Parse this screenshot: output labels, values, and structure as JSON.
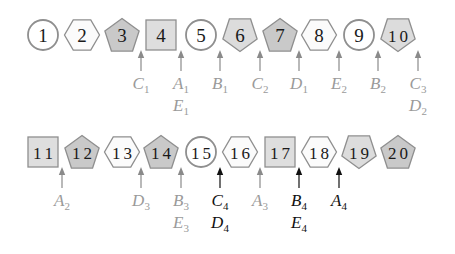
{
  "diagram": {
    "colors": {
      "circle_fill": "#ffffff",
      "hexagon_fill": "#fbfbfb",
      "pentagon_up_fill": "#c9c9c9",
      "square_fill": "#dedede",
      "pentagon_down_fill": "#dcdcdc",
      "outline": "#8f8f8f",
      "arrow_gray": "#8a8a8a",
      "arrow_black": "#111111",
      "number_text": "#1a1a1a"
    },
    "rows": [
      {
        "y": 35,
        "nodes": [
          {
            "n": "1",
            "shape": "circle",
            "x": 43
          },
          {
            "n": "2",
            "shape": "hexagon",
            "x": 82
          },
          {
            "n": "3",
            "shape": "pentagon-up",
            "x": 122
          },
          {
            "n": "4",
            "shape": "square",
            "x": 161
          },
          {
            "n": "5",
            "shape": "circle",
            "x": 201
          },
          {
            "n": "6",
            "shape": "pentagon-down",
            "x": 240
          },
          {
            "n": "7",
            "shape": "pentagon-up",
            "x": 280
          },
          {
            "n": "8",
            "shape": "hexagon",
            "x": 319
          },
          {
            "n": "9",
            "shape": "circle",
            "x": 359
          },
          {
            "n": "10",
            "shape": "pentagon-down",
            "x": 398
          }
        ],
        "pointers": [
          {
            "x": 141,
            "color": "gray",
            "labels": [
              [
                "C",
                "1"
              ]
            ]
          },
          {
            "x": 181,
            "color": "gray",
            "labels": [
              [
                "A",
                "1"
              ],
              [
                "E",
                "1"
              ]
            ]
          },
          {
            "x": 220,
            "color": "gray",
            "labels": [
              [
                "B",
                "1"
              ]
            ]
          },
          {
            "x": 260,
            "color": "gray",
            "labels": [
              [
                "C",
                "2"
              ]
            ]
          },
          {
            "x": 299,
            "color": "gray",
            "labels": [
              [
                "D",
                "1"
              ]
            ]
          },
          {
            "x": 339,
            "color": "gray",
            "labels": [
              [
                "E",
                "2"
              ]
            ]
          },
          {
            "x": 378,
            "color": "gray",
            "labels": [
              [
                "B",
                "2"
              ]
            ]
          },
          {
            "x": 418,
            "color": "gray",
            "labels": [
              [
                "C",
                "3"
              ],
              [
                "D",
                "2"
              ]
            ]
          }
        ]
      },
      {
        "y": 152,
        "nodes": [
          {
            "n": "11",
            "shape": "square",
            "x": 43
          },
          {
            "n": "12",
            "shape": "pentagon-up",
            "x": 82
          },
          {
            "n": "13",
            "shape": "hexagon",
            "x": 122
          },
          {
            "n": "14",
            "shape": "pentagon-up",
            "x": 161
          },
          {
            "n": "15",
            "shape": "circle",
            "x": 201
          },
          {
            "n": "16",
            "shape": "hexagon",
            "x": 240
          },
          {
            "n": "17",
            "shape": "square",
            "x": 280
          },
          {
            "n": "18",
            "shape": "hexagon",
            "x": 319
          },
          {
            "n": "19",
            "shape": "pentagon-down",
            "x": 359
          },
          {
            "n": "20",
            "shape": "pentagon-up",
            "x": 398
          }
        ],
        "pointers": [
          {
            "x": 62,
            "color": "gray",
            "labels": [
              [
                "A",
                "2"
              ]
            ]
          },
          {
            "x": 141,
            "color": "gray",
            "labels": [
              [
                "D",
                "3"
              ]
            ]
          },
          {
            "x": 181,
            "color": "gray",
            "labels": [
              [
                "B",
                "3"
              ],
              [
                "E",
                "3"
              ]
            ]
          },
          {
            "x": 220,
            "color": "black",
            "labels": [
              [
                "C",
                "4"
              ],
              [
                "D",
                "4"
              ]
            ]
          },
          {
            "x": 260,
            "color": "gray",
            "labels": [
              [
                "A",
                "3"
              ]
            ]
          },
          {
            "x": 299,
            "color": "black",
            "labels": [
              [
                "B",
                "4"
              ],
              [
                "E",
                "4"
              ]
            ]
          },
          {
            "x": 339,
            "color": "black",
            "labels": [
              [
                "A",
                "4"
              ]
            ]
          }
        ]
      }
    ]
  }
}
